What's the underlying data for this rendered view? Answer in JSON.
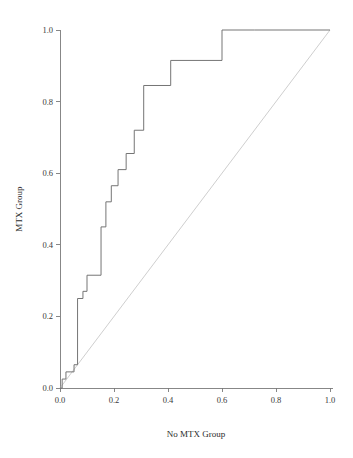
{
  "chart_data": {
    "type": "line",
    "title": "",
    "subtitle": "",
    "xlabel": "No MTX Group",
    "ylabel": "MTX Group",
    "xlim": [
      0.0,
      1.0
    ],
    "ylim": [
      0.0,
      1.0
    ],
    "grid": false,
    "legend": "none",
    "x_ticks": [
      "0.0",
      "0.2",
      "0.4",
      "0.6",
      "0.8",
      "1.0"
    ],
    "x_tick_values": [
      0.0,
      0.2,
      0.4,
      0.6,
      0.8,
      1.0
    ],
    "y_ticks": [
      "0.0",
      "0.2",
      "0.4",
      "0.6",
      "0.8",
      "1.0"
    ],
    "y_tick_values": [
      0.0,
      0.2,
      0.4,
      0.6,
      0.8,
      1.0
    ],
    "series": [
      {
        "name": "P-P step curve",
        "drawstyle": "steps-post",
        "color": "#6e6e6e",
        "x": [
          0.0,
          0.008,
          0.008,
          0.022,
          0.022,
          0.052,
          0.052,
          0.065,
          0.065,
          0.085,
          0.085,
          0.1,
          0.1,
          0.152,
          0.152,
          0.17,
          0.17,
          0.19,
          0.19,
          0.215,
          0.215,
          0.245,
          0.245,
          0.275,
          0.275,
          0.31,
          0.31,
          0.41,
          0.41,
          0.6,
          0.6,
          0.72,
          0.72,
          1.0
        ],
        "y": [
          0.0,
          0.0,
          0.025,
          0.025,
          0.045,
          0.045,
          0.065,
          0.065,
          0.25,
          0.25,
          0.27,
          0.27,
          0.315,
          0.315,
          0.45,
          0.45,
          0.52,
          0.52,
          0.565,
          0.565,
          0.61,
          0.61,
          0.655,
          0.655,
          0.72,
          0.72,
          0.845,
          0.845,
          0.915,
          0.915,
          1.0,
          1.0,
          1.0,
          1.0
        ]
      },
      {
        "name": "reference diagonal",
        "drawstyle": "line",
        "color": "#b9b9b9",
        "x": [
          0.0,
          1.0
        ],
        "y": [
          0.0,
          1.0
        ]
      }
    ]
  },
  "axes": {
    "x_title": "No MTX Group",
    "y_title": "MTX Group"
  }
}
